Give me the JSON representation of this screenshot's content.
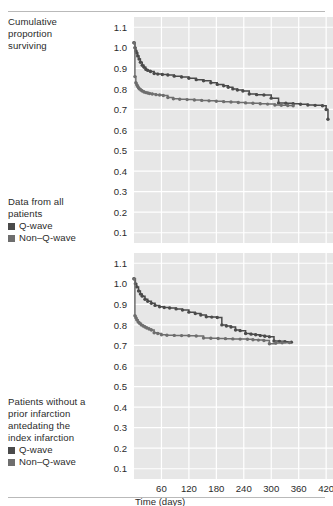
{
  "figure": {
    "y_axis_title_lines": [
      "Cumulative",
      "proportion",
      "surviving"
    ],
    "x_axis_title": "Time (days)",
    "colors": {
      "plot_background": "#e7e7e7",
      "gridline": "#ffffff",
      "q_wave": "#4a4a4a",
      "non_q_wave": "#6e6e6e",
      "text": "#2b2b2b",
      "rule": "#b9b9b9"
    },
    "legend_top": {
      "caption_lines": [
        "Data from all",
        "patients"
      ],
      "entries": [
        {
          "label": "Q-wave",
          "color": "#4a4a4a"
        },
        {
          "label": "Non–Q-wave",
          "color": "#6e6e6e"
        }
      ]
    },
    "legend_bottom": {
      "caption_lines": [
        "Patients without a",
        "prior infarction",
        "antedating the",
        "index infarction"
      ],
      "entries": [
        {
          "label": "Q-wave",
          "color": "#4a4a4a"
        },
        {
          "label": "Non–Q-wave",
          "color": "#6e6e6e"
        }
      ]
    }
  },
  "chart_data": [
    {
      "id": "chart-top",
      "type": "line",
      "title": "Data from all patients",
      "xlabel": "Time (days)",
      "ylabel": "Cumulative proportion surviving",
      "xlim": [
        0,
        435
      ],
      "ylim": [
        0.05,
        1.15
      ],
      "xticks": [
        60,
        120,
        180,
        240,
        300,
        360,
        420
      ],
      "xticklabels": [
        "60",
        "120",
        "180",
        "240",
        "300",
        "360",
        "420"
      ],
      "yticks": [
        0.1,
        0.2,
        0.3,
        0.4,
        0.5,
        0.6,
        0.7,
        0.8,
        0.9,
        1.0,
        1.1
      ],
      "yticklabels": [
        "0.1",
        "0.2",
        "0.3",
        "0.4",
        "0.5",
        "0.6",
        "0.7",
        "0.8",
        "0.9",
        "1.0",
        "1.1"
      ],
      "grid": true,
      "show_xticklabels": false,
      "series": [
        {
          "name": "Q-wave",
          "color": "#4a4a4a",
          "step": "post",
          "x": [
            0,
            2,
            4,
            6,
            8,
            11,
            14,
            18,
            22,
            26,
            30,
            36,
            44,
            52,
            62,
            74,
            88,
            104,
            120,
            136,
            152,
            168,
            182,
            196,
            206,
            216,
            226,
            238,
            252,
            268,
            284,
            300,
            316,
            332,
            348,
            364,
            380,
            396,
            412,
            420,
            424
          ],
          "y": [
            1.025,
            1.0,
            0.985,
            0.975,
            0.96,
            0.945,
            0.93,
            0.915,
            0.905,
            0.895,
            0.89,
            0.885,
            0.875,
            0.872,
            0.87,
            0.868,
            0.862,
            0.858,
            0.852,
            0.845,
            0.84,
            0.83,
            0.822,
            0.815,
            0.808,
            0.8,
            0.795,
            0.79,
            0.775,
            0.772,
            0.77,
            0.755,
            0.732,
            0.73,
            0.728,
            0.725,
            0.722,
            0.72,
            0.718,
            0.7,
            0.652
          ]
        },
        {
          "name": "Non–Q-wave",
          "color": "#6e6e6e",
          "step": "post",
          "x": [
            0,
            2,
            4,
            6,
            8,
            10,
            12,
            15,
            18,
            22,
            26,
            30,
            34,
            40,
            48,
            56,
            64,
            74,
            86,
            100,
            116,
            132,
            148,
            164,
            180,
            196,
            212,
            228,
            244,
            260,
            276,
            292,
            308,
            322,
            336,
            348
          ],
          "y": [
            1.025,
            0.86,
            0.83,
            0.82,
            0.812,
            0.805,
            0.8,
            0.795,
            0.79,
            0.785,
            0.782,
            0.78,
            0.778,
            0.775,
            0.772,
            0.77,
            0.768,
            0.758,
            0.752,
            0.75,
            0.748,
            0.746,
            0.744,
            0.742,
            0.74,
            0.738,
            0.736,
            0.734,
            0.732,
            0.73,
            0.728,
            0.726,
            0.722,
            0.72,
            0.719,
            0.718
          ]
        }
      ]
    },
    {
      "id": "chart-bottom",
      "type": "line",
      "title": "Patients without a prior infarction antedating the index infarction",
      "xlabel": "Time (days)",
      "ylabel": "Cumulative proportion surviving",
      "xlim": [
        0,
        435
      ],
      "ylim": [
        0.05,
        1.15
      ],
      "xticks": [
        60,
        120,
        180,
        240,
        300,
        360,
        420
      ],
      "xticklabels": [
        "60",
        "120",
        "180",
        "240",
        "300",
        "360",
        "420"
      ],
      "yticks": [
        0.1,
        0.2,
        0.3,
        0.4,
        0.5,
        0.6,
        0.7,
        0.8,
        0.9,
        1.0,
        1.1
      ],
      "yticklabels": [
        "0.1",
        "0.2",
        "0.3",
        "0.4",
        "0.5",
        "0.6",
        "0.7",
        "0.8",
        "0.9",
        "1.0",
        "1.1"
      ],
      "grid": true,
      "show_xticklabels": true,
      "series": [
        {
          "name": "Q-wave",
          "color": "#4a4a4a",
          "step": "post",
          "x": [
            0,
            3,
            6,
            10,
            14,
            18,
            24,
            30,
            38,
            46,
            56,
            66,
            78,
            92,
            106,
            120,
            134,
            146,
            158,
            170,
            182,
            192,
            202,
            212,
            222,
            232,
            244,
            256,
            266,
            276,
            286,
            296,
            306,
            318,
            330,
            344
          ],
          "y": [
            1.025,
            1.0,
            0.985,
            0.965,
            0.95,
            0.94,
            0.925,
            0.915,
            0.905,
            0.895,
            0.888,
            0.885,
            0.882,
            0.878,
            0.872,
            0.862,
            0.855,
            0.848,
            0.84,
            0.838,
            0.836,
            0.8,
            0.795,
            0.79,
            0.775,
            0.772,
            0.758,
            0.755,
            0.752,
            0.748,
            0.745,
            0.742,
            0.722,
            0.72,
            0.718,
            0.716
          ]
        },
        {
          "name": "Non–Q-wave",
          "color": "#6e6e6e",
          "step": "post",
          "x": [
            0,
            2,
            4,
            6,
            9,
            12,
            16,
            20,
            24,
            28,
            33,
            38,
            44,
            52,
            60,
            72,
            88,
            104,
            120,
            136,
            152,
            168,
            184,
            200,
            216,
            232,
            248,
            260,
            272,
            284,
            296,
            310,
            324,
            340
          ],
          "y": [
            1.025,
            0.845,
            0.835,
            0.825,
            0.815,
            0.808,
            0.8,
            0.795,
            0.79,
            0.785,
            0.78,
            0.775,
            0.762,
            0.758,
            0.752,
            0.75,
            0.749,
            0.748,
            0.747,
            0.746,
            0.736,
            0.735,
            0.734,
            0.733,
            0.732,
            0.731,
            0.73,
            0.728,
            0.726,
            0.724,
            0.708,
            0.712,
            0.713,
            0.714
          ]
        }
      ]
    }
  ]
}
